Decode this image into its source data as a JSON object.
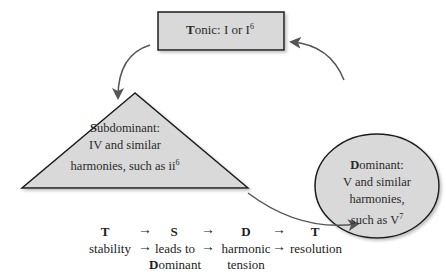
{
  "diagram": {
    "tonic": {
      "initial": "T",
      "rest": "onic: I or I",
      "sup": "6"
    },
    "subdominant": {
      "initial": "S",
      "rest": "ubdominant:",
      "line2": "IV and similar",
      "line3": "harmonies, such as ii",
      "sup": "6"
    },
    "dominant": {
      "initial": "D",
      "rest": "ominant:",
      "line2": "V and similar",
      "line3": "harmonies,",
      "line4": "such as V",
      "sup": "7"
    },
    "colors": {
      "fill": "#d9d9d9",
      "stroke": "#1a1a1a",
      "arrow": "#555555"
    }
  },
  "legend": {
    "headers": [
      "T",
      "S",
      "D",
      "T"
    ],
    "descriptions": [
      {
        "line1": "stability",
        "line2": ""
      },
      {
        "line1": "leads to",
        "line2_initial": "D",
        "line2_rest": "ominant"
      },
      {
        "line1": "harmonic",
        "line2": "tension"
      },
      {
        "line1": "resolution",
        "line2": ""
      }
    ],
    "arrow_glyph": "→"
  }
}
